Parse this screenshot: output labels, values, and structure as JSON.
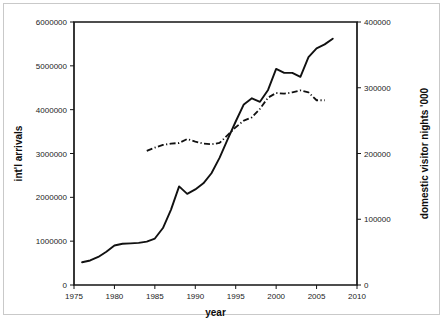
{
  "chart_data": {
    "type": "line",
    "title": "",
    "xlabel": "year",
    "ylabel": "int'l arrivals",
    "y2label": "domestic visitor nights '000",
    "xlim": [
      1975,
      2010
    ],
    "ylim": [
      0,
      6000000
    ],
    "y2lim": [
      0,
      400000
    ],
    "xticks": [
      1975,
      1980,
      1985,
      1990,
      1995,
      2000,
      2005,
      2010
    ],
    "xticklabels": [
      "1975",
      "1980",
      "1985",
      "1990",
      "1995",
      "2000",
      "2005",
      "2010"
    ],
    "yticks": [
      0,
      1000000,
      2000000,
      3000000,
      4000000,
      5000000,
      6000000
    ],
    "yticklabels": [
      "0",
      "1000000",
      "2000000",
      "3000000",
      "4000000",
      "5000000",
      "6000000"
    ],
    "y2ticks": [
      0,
      100000,
      200000,
      300000,
      400000
    ],
    "y2ticklabels": [
      "0",
      "100000",
      "200000",
      "300000",
      "400000"
    ],
    "grid": false,
    "legend": "none",
    "series": [
      {
        "name": "int'l arrivals",
        "axis": "left",
        "style": "solid",
        "x": [
          1976,
          1977,
          1978,
          1979,
          1980,
          1981,
          1982,
          1983,
          1984,
          1985,
          1986,
          1987,
          1988,
          1989,
          1990,
          1991,
          1992,
          1993,
          1994,
          1995,
          1996,
          1997,
          1998,
          1999,
          2000,
          2001,
          2002,
          2003,
          2004,
          2005,
          2006,
          2007
        ],
        "values": [
          520000,
          560000,
          640000,
          760000,
          900000,
          940000,
          950000,
          960000,
          990000,
          1060000,
          1300000,
          1720000,
          2250000,
          2080000,
          2180000,
          2320000,
          2550000,
          2900000,
          3320000,
          3730000,
          4120000,
          4260000,
          4180000,
          4450000,
          4930000,
          4840000,
          4840000,
          4750000,
          5200000,
          5400000,
          5490000,
          5620000
        ]
      },
      {
        "name": "domestic visitor nights '000",
        "axis": "right",
        "style": "dash-dot",
        "x": [
          1984,
          1985,
          1986,
          1987,
          1988,
          1989,
          1990,
          1991,
          1992,
          1993,
          1994,
          1995,
          1996,
          1997,
          1998,
          1999,
          2000,
          2001,
          2002,
          2003,
          2004,
          2005,
          2006
        ],
        "values": [
          204000,
          209000,
          213000,
          215000,
          216000,
          222000,
          218000,
          215000,
          214000,
          216000,
          228000,
          240000,
          250000,
          255000,
          268000,
          285000,
          292000,
          291000,
          293000,
          296000,
          293000,
          281000,
          281000
        ]
      }
    ]
  }
}
